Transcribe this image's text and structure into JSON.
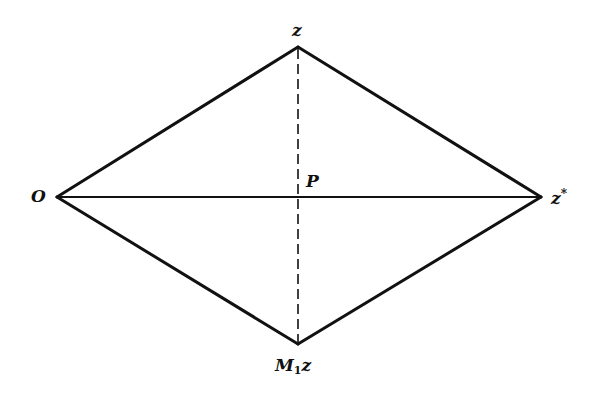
{
  "diagram": {
    "type": "rhombus",
    "vertices": {
      "left": {
        "name": "O",
        "x": 57,
        "y": 197
      },
      "top": {
        "name": "z",
        "x": 298,
        "y": 47
      },
      "right": {
        "name": "z*",
        "x": 541,
        "y": 197
      },
      "bottom": {
        "name": "M1z",
        "x": 298,
        "y": 344
      }
    },
    "center": {
      "name": "P",
      "x": 298,
      "y": 197
    },
    "labels": {
      "O": "O",
      "z": "z",
      "z_star_base": "z",
      "z_star_sup": "*",
      "P": "P",
      "M1z_base": "M",
      "M1z_sub": "1",
      "M1z_tail": "z"
    },
    "edges": [
      {
        "from": "O",
        "to": "z",
        "style": "solid"
      },
      {
        "from": "z",
        "to": "z*",
        "style": "solid"
      },
      {
        "from": "z*",
        "to": "M1z",
        "style": "solid"
      },
      {
        "from": "M1z",
        "to": "O",
        "style": "solid"
      }
    ],
    "diagonals": [
      {
        "from": "O",
        "to": "z*",
        "style": "solid"
      },
      {
        "from": "z",
        "to": "M1z",
        "style": "dashed"
      }
    ],
    "colors": {
      "line": "#111111",
      "background": "#ffffff"
    }
  }
}
